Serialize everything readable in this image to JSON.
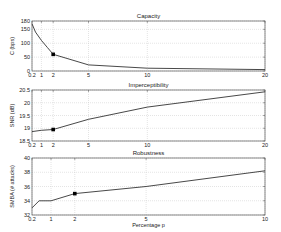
{
  "chart_data": [
    {
      "type": "line",
      "title": "Capacity",
      "xlabel": "",
      "ylabel": "C (bps)",
      "xlim": [
        0.2,
        20
      ],
      "ylim": [
        0,
        180
      ],
      "xticks": [
        0.2,
        1,
        2,
        5,
        10,
        20
      ],
      "yticks": [
        0,
        50,
        100,
        150,
        180
      ],
      "grid": true,
      "x": [
        0.2,
        0.5,
        1,
        1.5,
        2,
        5,
        10,
        20
      ],
      "y": [
        170,
        140,
        110,
        85,
        60,
        22,
        10,
        5
      ],
      "marker": {
        "x": 2,
        "y": 60
      }
    },
    {
      "type": "line",
      "title": "Imperceptibility",
      "xlabel": "",
      "ylabel": "SNR (dB)",
      "xlim": [
        0.2,
        20
      ],
      "ylim": [
        18.5,
        20.5
      ],
      "xticks": [
        0.2,
        1,
        2,
        5,
        10,
        20
      ],
      "yticks": [
        18.5,
        19,
        19.5,
        20,
        20.5
      ],
      "grid": true,
      "x": [
        0.2,
        1,
        2,
        5,
        10,
        20
      ],
      "y": [
        18.87,
        18.92,
        18.95,
        19.35,
        19.83,
        20.43
      ],
      "marker": {
        "x": 2,
        "y": 18.95
      }
    },
    {
      "type": "line",
      "title": "Robustness",
      "xlabel": "Percentage p",
      "ylabel": "SMBA (# attacks)",
      "xlim": [
        0.2,
        10
      ],
      "ylim": [
        32,
        40
      ],
      "xticks": [
        0.2,
        1,
        2,
        5,
        10
      ],
      "yticks": [
        32,
        34,
        36,
        38,
        40
      ],
      "grid": true,
      "x": [
        0.2,
        0.5,
        1,
        2,
        5,
        10
      ],
      "y": [
        33,
        34,
        34,
        35,
        36,
        38.2
      ],
      "marker": {
        "x": 2,
        "y": 35
      }
    }
  ]
}
